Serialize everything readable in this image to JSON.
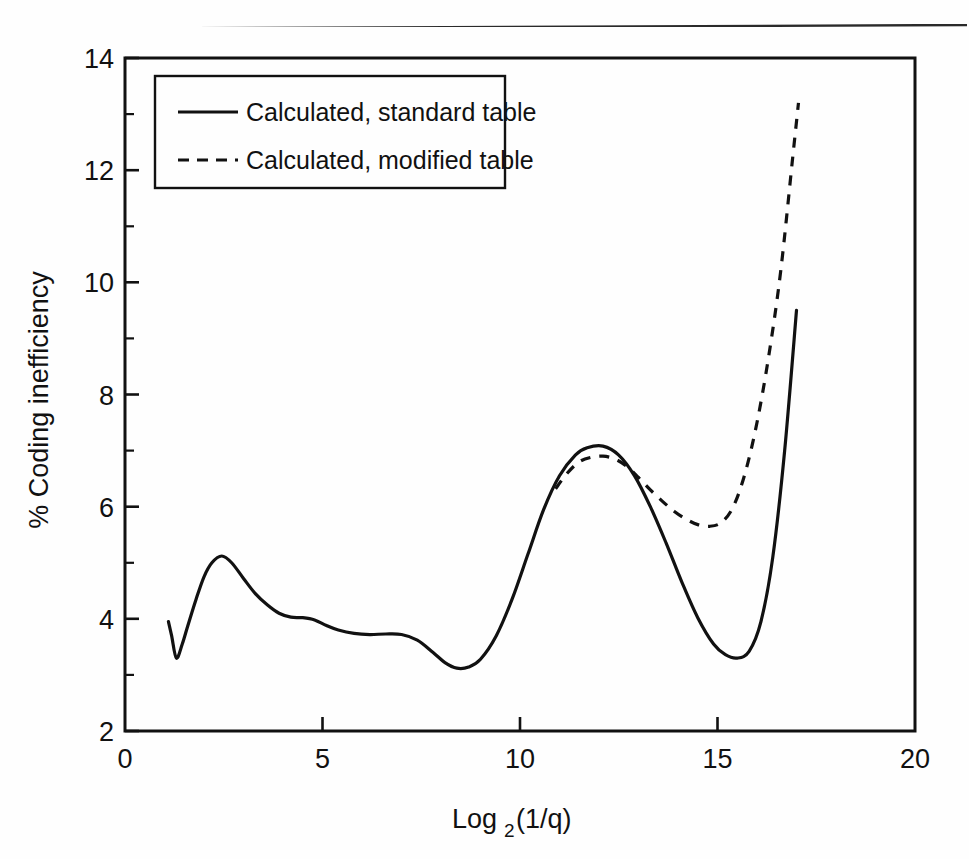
{
  "page": {
    "background_color": "#ffffff",
    "ink_color": "#111111",
    "top_rule": "horizontal-rule"
  },
  "chart_data": {
    "type": "line",
    "title": "",
    "subtitle": "",
    "xlabel": "Log2(1/q)",
    "xlabel_base": "Log",
    "xlabel_sub": "2",
    "xlabel_tail": "(1/q)",
    "ylabel": "% Coding inefficiency",
    "xlim": [
      0,
      20
    ],
    "ylim": [
      2,
      14
    ],
    "xticks": [
      0,
      5,
      10,
      15,
      20
    ],
    "xtick_labels": [
      "0",
      "5",
      "10",
      "15",
      "20"
    ],
    "yticks": [
      2,
      4,
      6,
      8,
      10,
      12,
      14
    ],
    "ytick_labels": [
      "2",
      "4",
      "6",
      "8",
      "10",
      "12",
      "14"
    ],
    "minor_yticks": [
      3,
      5,
      7,
      9,
      11,
      13
    ],
    "grid": false,
    "legend_position": "top-left-inside",
    "series": [
      {
        "name": "Calculated, standard table",
        "style": "solid",
        "color": "#111111",
        "x": [
          1.1,
          1.18,
          1.3,
          1.45,
          1.6,
          1.8,
          2.0,
          2.2,
          2.45,
          2.7,
          3.0,
          3.3,
          3.6,
          3.9,
          4.2,
          4.5,
          4.8,
          5.1,
          5.4,
          5.8,
          6.2,
          6.6,
          7.0,
          7.4,
          7.8,
          8.1,
          8.4,
          8.7,
          9.0,
          9.4,
          9.8,
          10.2,
          10.6,
          11.0,
          11.4,
          11.7,
          12.1,
          12.5,
          12.9,
          13.3,
          13.7,
          14.1,
          14.5,
          14.9,
          15.2,
          15.5,
          15.8,
          16.1,
          16.4,
          16.7,
          17.0
        ],
        "y": [
          3.95,
          3.7,
          3.3,
          3.55,
          3.9,
          4.35,
          4.75,
          5.0,
          5.12,
          5.0,
          4.72,
          4.45,
          4.25,
          4.1,
          4.03,
          4.02,
          3.98,
          3.88,
          3.8,
          3.74,
          3.72,
          3.73,
          3.72,
          3.62,
          3.4,
          3.22,
          3.12,
          3.14,
          3.28,
          3.7,
          4.35,
          5.15,
          5.95,
          6.55,
          6.92,
          7.05,
          7.08,
          6.92,
          6.55,
          6.0,
          5.35,
          4.65,
          4.02,
          3.55,
          3.36,
          3.3,
          3.42,
          3.95,
          5.1,
          7.0,
          9.5
        ]
      },
      {
        "name": "Calculated, modified table",
        "style": "dashed",
        "color": "#111111",
        "x": [
          10.9,
          11.2,
          11.5,
          11.8,
          12.1,
          12.4,
          12.7,
          13.0,
          13.3,
          13.6,
          13.9,
          14.2,
          14.5,
          14.8,
          15.1,
          15.4,
          15.7,
          16.0,
          16.3,
          16.6,
          16.9,
          17.05
        ],
        "y": [
          6.32,
          6.6,
          6.8,
          6.88,
          6.9,
          6.85,
          6.72,
          6.52,
          6.3,
          6.1,
          5.92,
          5.78,
          5.68,
          5.65,
          5.72,
          6.0,
          6.6,
          7.5,
          8.7,
          10.2,
          12.2,
          13.2
        ]
      }
    ],
    "annotations": []
  },
  "legend": {
    "box": "legend-box",
    "entries": [
      {
        "label": "Calculated, standard table",
        "style": "solid"
      },
      {
        "label": "Calculated, modified table",
        "style": "dashed"
      }
    ]
  }
}
